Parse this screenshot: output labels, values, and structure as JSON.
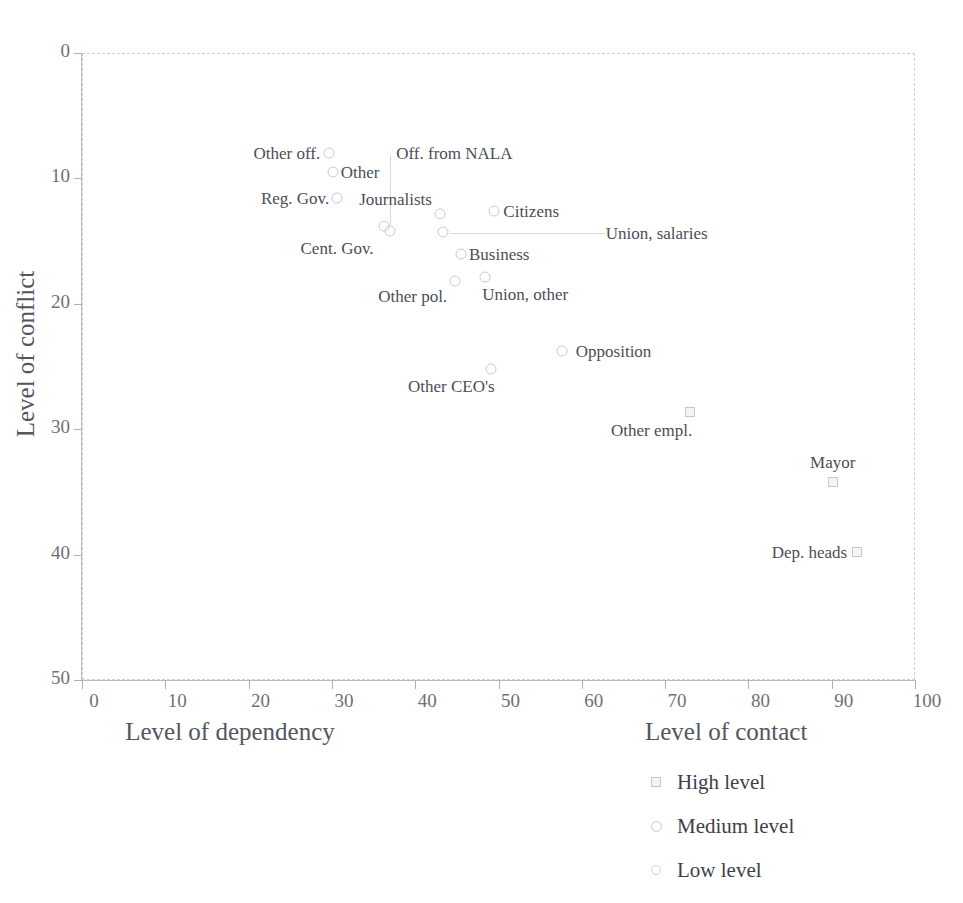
{
  "title": "",
  "axes": {
    "ylabel": "Level of conflict",
    "xlabel": "Level of dependency",
    "yticks": [
      "50",
      "40",
      "30",
      "20",
      "10",
      "0"
    ],
    "xticks": [
      "0",
      "10",
      "20",
      "30",
      "40",
      "50",
      "60",
      "70",
      "80",
      "90",
      "100"
    ]
  },
  "legend": {
    "title": "Level of contact",
    "items": [
      {
        "label": "High level",
        "shape": "square"
      },
      {
        "label": "Medium level",
        "shape": "circle"
      },
      {
        "label": "Low level",
        "shape": "circle-small"
      }
    ]
  },
  "colors": {
    "axis": "#b9b9c2",
    "grid": "#cfcfd6",
    "marker_stroke": "#c9c9d2",
    "text": "#4d4d57"
  },
  "chart_data": {
    "type": "scatter",
    "title": "",
    "xlabel": "Level of dependency",
    "ylabel": "Level of conflict",
    "xlim": [
      0,
      100
    ],
    "ylim": [
      0,
      50
    ],
    "xticks": [
      0,
      10,
      20,
      30,
      40,
      50,
      60,
      70,
      80,
      90,
      100
    ],
    "yticks": [
      0,
      10,
      20,
      30,
      40,
      50
    ],
    "grid": true,
    "legend_position": "below-right",
    "series": [
      {
        "name": "High level",
        "marker": "square",
        "points": [
          {
            "label": "Other empl.",
            "x": 73.0,
            "y": 21.4
          },
          {
            "label": "Mayor",
            "x": 90.1,
            "y": 15.8
          },
          {
            "label": "Dep. heads",
            "x": 93.0,
            "y": 10.2
          }
        ]
      },
      {
        "name": "Medium level",
        "marker": "circle",
        "points": [
          {
            "label": "Other off.",
            "x": 29.6,
            "y": 42.0
          },
          {
            "label": "Other",
            "x": 30.1,
            "y": 40.5
          },
          {
            "label": "Reg. Gov.",
            "x": 30.6,
            "y": 38.4
          },
          {
            "label": "Cent. Gov.",
            "x": 36.2,
            "y": 36.2
          },
          {
            "label": "Off. from NALA",
            "x": 37.0,
            "y": 35.8
          },
          {
            "label": "Journalists",
            "x": 43.0,
            "y": 37.2
          },
          {
            "label": "Citizens",
            "x": 49.5,
            "y": 37.4
          },
          {
            "label": "Union, salaries",
            "x": 43.3,
            "y": 35.7
          },
          {
            "label": "Business",
            "x": 45.5,
            "y": 34.0
          },
          {
            "label": "Other pol.",
            "x": 44.8,
            "y": 31.8
          },
          {
            "label": "Union, other",
            "x": 48.4,
            "y": 32.1
          },
          {
            "label": "Opposition",
            "x": 57.6,
            "y": 26.2
          },
          {
            "label": "Other CEO's",
            "x": 49.1,
            "y": 24.8
          }
        ]
      },
      {
        "name": "Low level",
        "marker": "circle-small",
        "points": []
      }
    ]
  },
  "points": [
    {
      "name": "Other off.",
      "x": 29.6,
      "y": 42.0,
      "shape": "circle",
      "label": "Other off.",
      "lx": -8,
      "ly": 0,
      "anchor": "right"
    },
    {
      "name": "Other",
      "x": 30.1,
      "y": 40.5,
      "shape": "circle",
      "label": "Other",
      "lx": 8,
      "ly": 0,
      "anchor": "left"
    },
    {
      "name": "Reg. Gov.",
      "x": 30.6,
      "y": 38.4,
      "shape": "circle",
      "label": "Reg. Gov.",
      "lx": -8,
      "ly": 0,
      "anchor": "right"
    },
    {
      "name": "Cent. Gov.",
      "x": 36.2,
      "y": 36.2,
      "shape": "circle",
      "label": "Cent. Gov.",
      "lx": -10,
      "ly": 22,
      "anchor": "right"
    },
    {
      "name": "Off. from NALA",
      "x": 37.0,
      "y": 35.8,
      "shape": "circle",
      "label": "Off. from NALA",
      "lx": 6,
      "ly": -78,
      "anchor": "left"
    },
    {
      "name": "Journalists",
      "x": 43.0,
      "y": 37.2,
      "shape": "circle",
      "label": "Journalists",
      "lx": -8,
      "ly": -15,
      "anchor": "right"
    },
    {
      "name": "Citizens",
      "x": 49.5,
      "y": 37.4,
      "shape": "circle",
      "label": "Citizens",
      "lx": 9,
      "ly": 0,
      "anchor": "left"
    },
    {
      "name": "Union, salaries",
      "x": 43.3,
      "y": 35.7,
      "shape": "circle",
      "label": "Union, salaries",
      "lx": 163,
      "ly": 1,
      "anchor": "left"
    },
    {
      "name": "Business",
      "x": 45.5,
      "y": 34.0,
      "shape": "circle",
      "label": "Business",
      "lx": 8,
      "ly": 0,
      "anchor": "left"
    },
    {
      "name": "Other pol.",
      "x": 44.8,
      "y": 31.8,
      "shape": "circle",
      "label": "Other pol.",
      "lx": -8,
      "ly": 15,
      "anchor": "right"
    },
    {
      "name": "Union, other",
      "x": 48.4,
      "y": 32.1,
      "shape": "circle",
      "label": "Union, other",
      "lx": -3,
      "ly": 17,
      "anchor": "left"
    },
    {
      "name": "Opposition",
      "x": 57.6,
      "y": 26.2,
      "shape": "circle",
      "label": "Opposition",
      "lx": 14,
      "ly": 0,
      "anchor": "left"
    },
    {
      "name": "Other CEO's",
      "x": 49.1,
      "y": 24.8,
      "shape": "circle",
      "label": "Other CEO's",
      "lx": 4,
      "ly": 17,
      "anchor": "right"
    },
    {
      "name": "Other empl.",
      "x": 73.0,
      "y": 21.4,
      "shape": "square",
      "label": "Other empl.",
      "lx": 2,
      "ly": 18,
      "anchor": "right"
    },
    {
      "name": "Mayor",
      "x": 90.1,
      "y": 15.8,
      "shape": "square",
      "label": "Mayor",
      "lx": 0,
      "ly": -20,
      "anchor": "center"
    },
    {
      "name": "Dep. heads",
      "x": 93.0,
      "y": 10.2,
      "shape": "square",
      "label": "Dep. heads",
      "lx": -9,
      "ly": 0,
      "anchor": "right"
    }
  ],
  "leaders": [
    {
      "name": "nala-leader",
      "orient": "v",
      "x": 390,
      "y": 155,
      "len": 70
    },
    {
      "name": "union-leader",
      "orient": "h",
      "x": 450,
      "y": 233,
      "len": 155
    }
  ]
}
